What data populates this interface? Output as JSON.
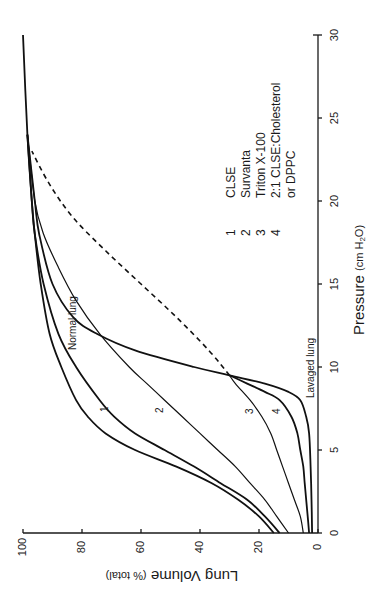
{
  "chart_data": {
    "type": "line",
    "orientation": "rotated-90-ccw",
    "title": "",
    "xlabel": "Pressure (cm H2O)",
    "xlabel_parts": {
      "main": "Pressure",
      "unit_open": "(cm H",
      "sub": "2",
      "unit_close": "O)"
    },
    "ylabel": "Lung Volume (% total)",
    "ylabel_parts": {
      "main": "Lung Volume",
      "unit": "(% total)"
    },
    "xlim": [
      0,
      30
    ],
    "ylim": [
      0,
      100
    ],
    "x_ticks": [
      "0",
      "5",
      "10",
      "15",
      "20",
      "25",
      "30"
    ],
    "y_ticks": [
      "0",
      "20",
      "40",
      "60",
      "80",
      "100"
    ],
    "grid": false,
    "legend": [
      {
        "num": "1",
        "label": "CLSE"
      },
      {
        "num": "2",
        "label": "Survanta"
      },
      {
        "num": "3",
        "label": "Triton X-100"
      },
      {
        "num": "4",
        "label": "2:1 CLSE:Cholesterol"
      },
      {
        "num": "",
        "label": "or DPPC"
      }
    ],
    "annotations": [
      "Normal lung",
      "Lavaged lung",
      "1",
      "2",
      "3",
      "4"
    ],
    "series": [
      {
        "name": "Normal lung",
        "style": "solid",
        "x": [
          0,
          1,
          2,
          3,
          4,
          5,
          6,
          7,
          8,
          10,
          12,
          15,
          18,
          20,
          24,
          30
        ],
        "y": [
          15,
          20,
          27,
          36,
          48,
          62,
          72,
          78,
          82,
          87,
          91,
          94,
          96,
          97,
          98.5,
          100
        ]
      },
      {
        "name": "1 CLSE",
        "style": "solid",
        "x": [
          0,
          1,
          2,
          3,
          4,
          5,
          6,
          7,
          8,
          10,
          12,
          15,
          18,
          20,
          24
        ],
        "y": [
          13,
          18,
          24,
          33,
          42,
          52,
          62,
          69,
          74,
          82,
          88,
          93,
          96,
          97,
          98.5
        ]
      },
      {
        "name": "2 Survanta",
        "style": "solid",
        "x": [
          0,
          1,
          2,
          3,
          4,
          5,
          6,
          7,
          8,
          9,
          10,
          12,
          14,
          16,
          18,
          20,
          24
        ],
        "y": [
          10,
          14,
          18,
          23,
          28,
          34,
          40,
          46,
          52,
          58,
          64,
          74,
          82,
          88,
          93,
          96,
          98.5
        ]
      },
      {
        "name": "3 Triton X-100",
        "style": "solid",
        "x": [
          0,
          1,
          2,
          3,
          4,
          5,
          6,
          7,
          8,
          9,
          9.5
        ],
        "y": [
          5,
          6,
          8,
          10,
          12,
          14,
          16,
          19,
          23,
          28,
          30
        ]
      },
      {
        "name": "4 2:1 CLSE:Cholesterol or DPPC",
        "style": "solid",
        "x": [
          0,
          1,
          2,
          3,
          4,
          5,
          6,
          7,
          8,
          8.5,
          9,
          9.5
        ],
        "y": [
          3,
          3.5,
          4,
          4.5,
          5,
          6,
          7,
          9,
          13,
          18,
          24,
          30
        ]
      },
      {
        "name": "Lavaged lung",
        "style": "solid",
        "x": [
          0,
          2,
          4,
          6,
          7,
          8,
          8.5,
          9,
          9.5,
          10,
          11,
          12,
          13,
          15,
          18,
          20,
          24
        ],
        "y": [
          2,
          2.2,
          2.5,
          3,
          4,
          6,
          10,
          18,
          30,
          42,
          62,
          75,
          83,
          90,
          94.5,
          96,
          98.5
        ]
      },
      {
        "name": "Lavaged lung (dashed)",
        "style": "dashed",
        "x": [
          9.5,
          11,
          13,
          15,
          17,
          19,
          21,
          23
        ],
        "y": [
          30,
          37,
          48,
          60,
          72,
          83,
          91,
          97
        ]
      }
    ]
  }
}
